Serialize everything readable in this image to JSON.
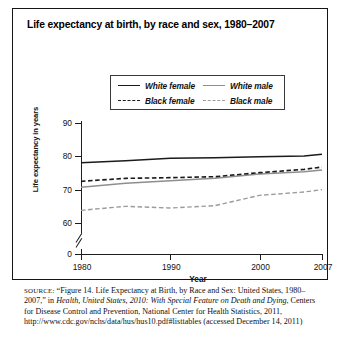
{
  "figure": {
    "title": "Life expectancy at birth, by race and sex, 1980–2007",
    "source_prefix": "SOURCE:",
    "source_part1": " “Figure 14. Life Expectancy at Birth, by Race and Sex: United States, 1980–2007,” in ",
    "source_italic": "Health, United States, 2010: With Special Feature on Death and Dying",
    "source_part2": ", Centers for Disease Control and Prevention, National Center for Health Statistics, 2011, http://www.cdc.gov/nchs/data/hus/hus10.pdf#listtables (accessed December 14, 2011)"
  },
  "chart_data": {
    "type": "line",
    "title": "Life expectancy at birth, by race and sex, 1980–2007",
    "xlabel": "Year",
    "ylabel": "Life expectancy in years",
    "x": [
      1980,
      1985,
      1990,
      1995,
      2000,
      2005,
      2007
    ],
    "xlim": [
      1980,
      2007
    ],
    "ylim": [
      60,
      90
    ],
    "y_axis_break": true,
    "xticks": [
      "1980",
      "1990",
      "2000",
      "2007"
    ],
    "xtick_values": [
      1980,
      1990,
      2000,
      2007
    ],
    "yticks": [
      "0",
      "60",
      "70",
      "80",
      "90"
    ],
    "ytick_values": [
      0,
      60,
      70,
      80,
      90
    ],
    "grid": false,
    "legend_position": "top-center",
    "series": [
      {
        "name": "White female",
        "style": "solid",
        "color": "#1b1b1b",
        "width": 1.5,
        "values": [
          78.1,
          78.7,
          79.4,
          79.6,
          79.9,
          80.1,
          80.6
        ]
      },
      {
        "name": "White male",
        "style": "solid",
        "color": "#8e8e8e",
        "width": 1.5,
        "values": [
          70.7,
          71.9,
          72.7,
          73.4,
          74.7,
          75.4,
          75.9
        ]
      },
      {
        "name": "Black female",
        "style": "dashed",
        "color": "#1b1b1b",
        "width": 1.6,
        "values": [
          72.5,
          73.4,
          73.6,
          73.9,
          75.1,
          76.1,
          76.8
        ]
      },
      {
        "name": "Black male",
        "style": "dashed",
        "color": "#9b9b9b",
        "width": 1.4,
        "values": [
          63.8,
          65.0,
          64.5,
          65.2,
          68.3,
          69.3,
          70.0
        ]
      }
    ]
  },
  "legend": {
    "items": [
      {
        "label": "White female",
        "swatch": "solid-dark"
      },
      {
        "label": "White male",
        "swatch": "solid-light"
      },
      {
        "label": "Black female",
        "swatch": "dash-dark"
      },
      {
        "label": "Black male",
        "swatch": "dash-light"
      }
    ]
  }
}
